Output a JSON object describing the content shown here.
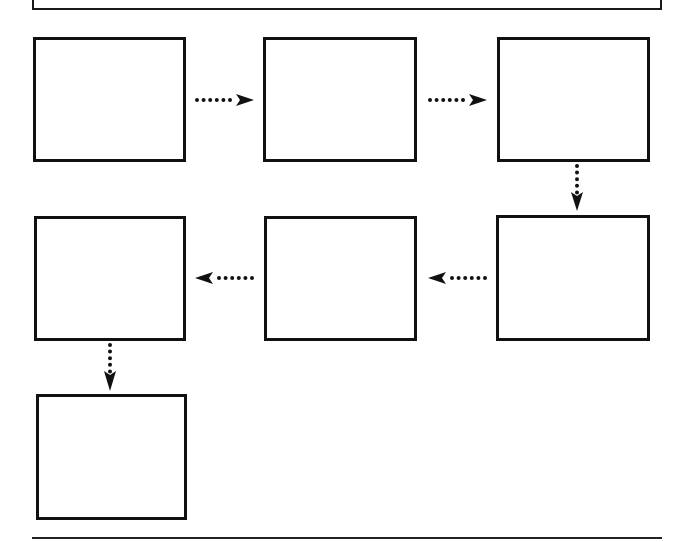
{
  "diagram": {
    "type": "flowchart",
    "colors": {
      "stroke": "#111111",
      "background": "#ffffff"
    },
    "banner": {
      "label": ""
    },
    "boxes": [
      {
        "id": "box-1",
        "label": "",
        "row": 1,
        "col": 1,
        "x": 33,
        "y": 37,
        "w": 153,
        "h": 125
      },
      {
        "id": "box-2",
        "label": "",
        "row": 1,
        "col": 2,
        "x": 263,
        "y": 37,
        "w": 154,
        "h": 125
      },
      {
        "id": "box-3",
        "label": "",
        "row": 1,
        "col": 3,
        "x": 497,
        "y": 37,
        "w": 153,
        "h": 125
      },
      {
        "id": "box-4",
        "label": "",
        "row": 2,
        "col": 3,
        "x": 496,
        "y": 215,
        "w": 154,
        "h": 126
      },
      {
        "id": "box-5",
        "label": "",
        "row": 2,
        "col": 2,
        "x": 264,
        "y": 216,
        "w": 153,
        "h": 125
      },
      {
        "id": "box-6",
        "label": "",
        "row": 2,
        "col": 1,
        "x": 34,
        "y": 216,
        "w": 152,
        "h": 125
      },
      {
        "id": "box-7",
        "label": "",
        "row": 3,
        "col": 1,
        "x": 36,
        "y": 394,
        "w": 151,
        "h": 126
      }
    ],
    "arrows": [
      {
        "from": "box-1",
        "to": "box-2",
        "direction": "right",
        "style": "dotted"
      },
      {
        "from": "box-2",
        "to": "box-3",
        "direction": "right",
        "style": "dotted"
      },
      {
        "from": "box-3",
        "to": "box-4",
        "direction": "down",
        "style": "dotted"
      },
      {
        "from": "box-4",
        "to": "box-5",
        "direction": "left",
        "style": "dotted"
      },
      {
        "from": "box-5",
        "to": "box-6",
        "direction": "left",
        "style": "dotted"
      },
      {
        "from": "box-6",
        "to": "box-7",
        "direction": "down",
        "style": "dotted"
      }
    ]
  }
}
